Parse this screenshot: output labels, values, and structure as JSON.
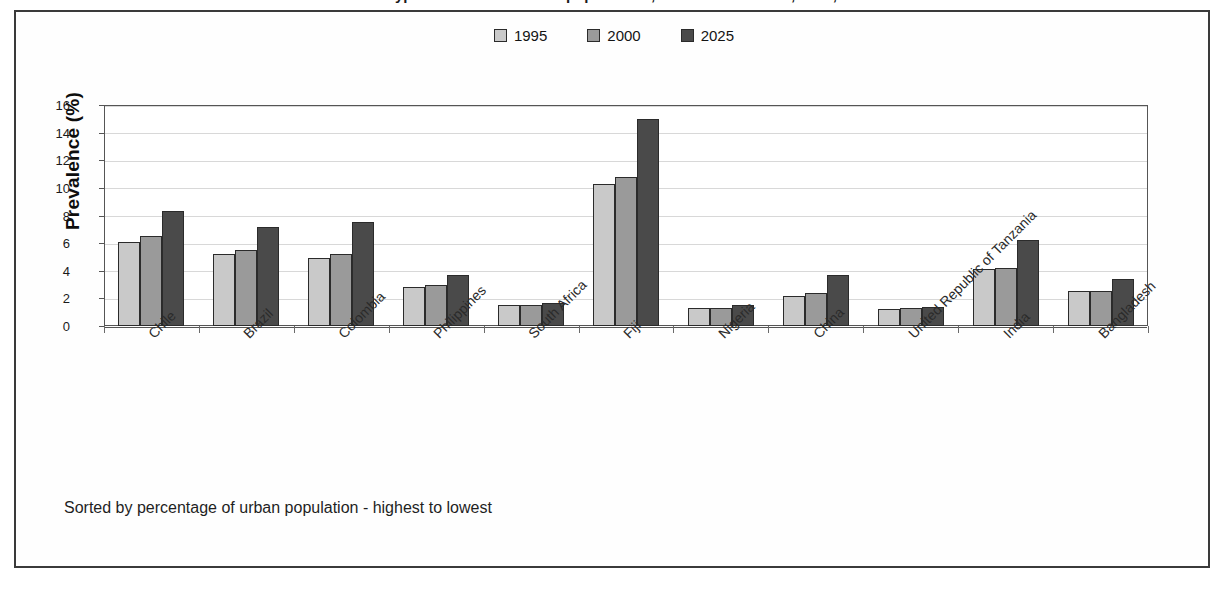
{
  "title_cropped": "Prevalence of Type 2 diabetes in urban populations, selected countries, 1995, 2000 and 2025",
  "legend": {
    "items": [
      {
        "label": "1995",
        "color": "#c9c9c9"
      },
      {
        "label": "2000",
        "color": "#9a9a9a"
      },
      {
        "label": "2025",
        "color": "#4a4a4a"
      }
    ]
  },
  "footnote": "Sorted by percentage of urban population - highest to lowest",
  "axis": {
    "y_title": "Prevalence (%)",
    "y_ticks": [
      "0",
      "2",
      "4",
      "6",
      "8",
      "10",
      "12",
      "14",
      "16"
    ]
  },
  "chart_data": {
    "type": "bar",
    "title": "Prevalence of Type 2 diabetes in urban populations, selected countries, 1995, 2000 and 2025",
    "xlabel": "",
    "ylabel": "Prevalence (%)",
    "ylim": [
      0,
      16
    ],
    "ytick_step": 2,
    "grid": true,
    "legend_position": "top-center",
    "note": "Sorted by percentage of urban population - highest to lowest",
    "categories": [
      "Chile",
      "Brazil",
      "Colombia",
      "Philippines",
      "South Africa",
      "Fiji",
      "Nigeria",
      "China",
      "United Republic of Tanzania",
      "India",
      "Bangladesh"
    ],
    "series": [
      {
        "name": "1995",
        "color": "#c9c9c9",
        "values": [
          6.1,
          5.2,
          4.9,
          2.8,
          1.5,
          10.3,
          1.3,
          2.2,
          1.2,
          4.1,
          2.5
        ]
      },
      {
        "name": "2000",
        "color": "#9a9a9a",
        "values": [
          6.5,
          5.5,
          5.2,
          3.0,
          1.5,
          10.8,
          1.3,
          2.4,
          1.3,
          4.2,
          2.5
        ]
      },
      {
        "name": "2025",
        "color": "#4a4a4a",
        "values": [
          8.3,
          7.2,
          7.5,
          3.7,
          1.7,
          15.0,
          1.5,
          3.7,
          1.4,
          6.2,
          3.4
        ]
      }
    ]
  }
}
